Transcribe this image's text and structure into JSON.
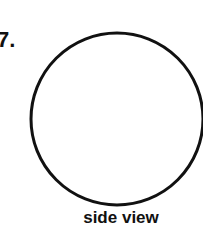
{
  "problem": {
    "number": "7.",
    "caption": "side view"
  },
  "figure": {
    "shape": "circle",
    "stroke_color": "#111111",
    "fill_color": "#ffffff"
  }
}
